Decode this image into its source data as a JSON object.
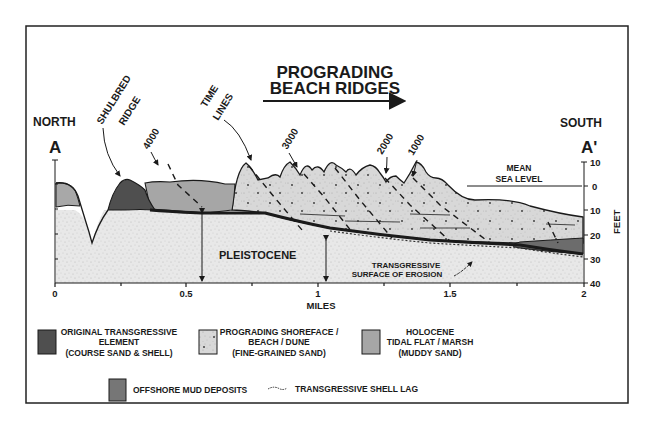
{
  "title": {
    "line1": "PROGRADING",
    "line2": "BEACH RIDGES"
  },
  "section": {
    "left_direction": "NORTH",
    "left_label": "A",
    "right_direction": "SOUTH",
    "right_label": "A'"
  },
  "annotations": {
    "shulbred_line1": "SHULBRED",
    "shulbred_line2": "RIDGE",
    "time_line1": "TIME",
    "time_line2": "LINES",
    "t4000": "4000",
    "t3000": "3000",
    "t2000": "2000",
    "t1000": "1000",
    "msl_line1": "MEAN",
    "msl_line2": "SEA LEVEL",
    "pleistocene": "PLEISTOCENE",
    "tse_line1": "TRANSGRESSIVE",
    "tse_line2": "SURFACE OF EROSION"
  },
  "axes": {
    "x_label": "MILES",
    "x_ticks": [
      "0",
      "0.5",
      "1",
      "1.5",
      "2"
    ],
    "y_label": "FEET",
    "y_ticks": [
      "10",
      "0",
      "10",
      "20",
      "30",
      "40"
    ]
  },
  "legend": {
    "items": [
      {
        "label1": "ORIGINAL TRANSGRESSIVE",
        "label2": "ELEMENT",
        "label3": "(COURSE SAND & SHELL)",
        "color": "#555555"
      },
      {
        "label1": "PROGRADING SHOREFACE /",
        "label2": "BEACH / DUNE",
        "label3": "(FINE-GRAINED SAND)",
        "color": "#dcdcdc"
      },
      {
        "label1": "HOLOCENE",
        "label2": "TIDAL FLAT / MARSH",
        "label3": "(MUDDY SAND)",
        "color": "#a8a8a8"
      },
      {
        "label1": "OFFSHORE MUD DEPOSITS",
        "color": "#7a7a7a"
      },
      {
        "label1": "TRANSGRESSIVE SHELL LAG",
        "color": "#333333"
      }
    ]
  },
  "colors": {
    "pleistocene": "#e6e6e6",
    "prograding": "#d6d6d6",
    "holocene": "#a6a6a6",
    "original": "#4f4f4f",
    "offshore_mud": "#767676",
    "line": "#1a1a1a"
  }
}
